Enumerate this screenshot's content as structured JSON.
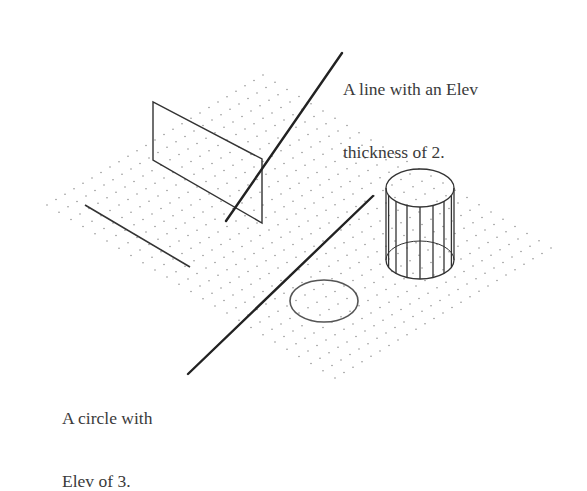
{
  "diagram": {
    "type": "isometric drawing",
    "annotations": [
      {
        "id": "line",
        "lines": [
          "A line with an Elev",
          "thickness of 2."
        ]
      },
      {
        "id": "circle",
        "lines": [
          "A circle with",
          "Elev of 3."
        ]
      }
    ],
    "colors": {
      "ink": "#333333",
      "grid_dot": "#8a8a8a",
      "text": "#3a3a3a",
      "background": "#ffffff"
    },
    "grid": {
      "shape": "isometric diamond",
      "top": [
        263,
        75
      ],
      "right": [
        551,
        248
      ],
      "bottom": [
        337,
        380
      ],
      "left": [
        47,
        205
      ],
      "rows": 24,
      "cols": 24
    },
    "objects": [
      {
        "name": "extruded line (vertical plane)",
        "points": [
          [
            153,
            102
          ],
          [
            153,
            160
          ],
          [
            262,
            223
          ],
          [
            262,
            159
          ]
        ]
      },
      {
        "name": "flat line",
        "from": [
          85,
          205
        ],
        "to": [
          190,
          267
        ]
      },
      {
        "name": "cylinder",
        "cx": 420,
        "top_cy": 188,
        "bottom_cy": 260,
        "rx": 34,
        "ry": 19,
        "vertical_lines": 9
      },
      {
        "name": "ellipse",
        "cx": 324,
        "cy": 301,
        "rx": 34,
        "ry": 21
      }
    ],
    "leaders": [
      {
        "target": "line",
        "from": [
          226,
          221
        ],
        "to": [
          342,
          53
        ]
      },
      {
        "target": "circle",
        "from": [
          188,
          374
        ],
        "to": [
          373,
          196
        ]
      }
    ]
  }
}
